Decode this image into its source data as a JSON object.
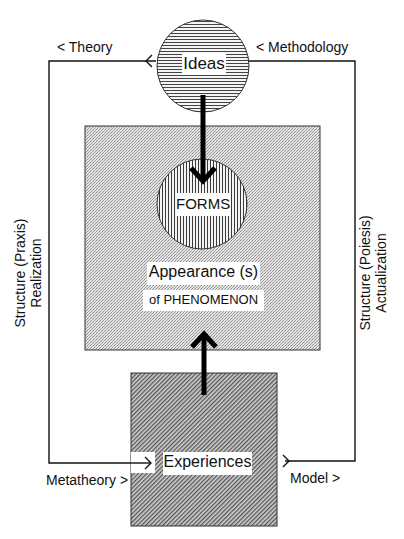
{
  "diagram": {
    "nodes": {
      "ideas": {
        "label": "Ideas",
        "shape": "circle",
        "fill": "horizontal-hatch"
      },
      "forms": {
        "label": "FORMS",
        "shape": "circle",
        "fill": "vertical-hatch"
      },
      "appearance": {
        "label_line1": "Appearance (s)",
        "label_line2": "of PHENOMENON",
        "shape": "rectangle",
        "fill": "fine-stipple"
      },
      "experiences": {
        "label": "Experiences",
        "shape": "rectangle",
        "fill": "diagonal-hatch"
      }
    },
    "edge_labels": {
      "theory": "< Theory",
      "methodology": "< Methodology",
      "metatheory": "Metatheory >",
      "model": "Model >"
    },
    "side_labels": {
      "left_line1": "Structure (Praxis)",
      "left_line2": "Realization",
      "right_line1": "Structure (Poiesis)",
      "right_line2": "Actualization"
    },
    "colors": {
      "line": "#111111",
      "background": "#ffffff",
      "label_bg": "#ffffff"
    }
  }
}
